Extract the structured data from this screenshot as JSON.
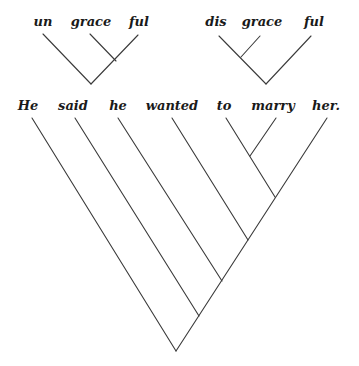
{
  "diagrams": {
    "ungraceful": {
      "words": [
        "un",
        "grace",
        "ful"
      ]
    },
    "disgraceful": {
      "words": [
        "dis",
        "grace",
        "ful"
      ]
    },
    "sentence": {
      "words": [
        "He",
        "said",
        "he",
        "wanted",
        "to",
        "marry",
        "her."
      ]
    }
  },
  "colors": {
    "line": "#3a3a3a",
    "text": "#1a1a1a",
    "background": "#ffffff"
  }
}
